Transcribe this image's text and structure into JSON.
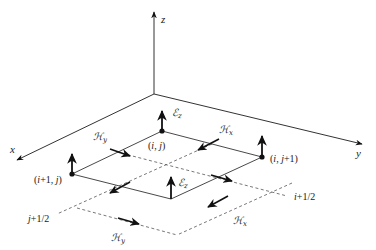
{
  "figure": {
    "colors": {
      "line": "#333333",
      "dashed": "#555555",
      "arrow": "#111111",
      "background": "#ffffff"
    }
  },
  "axes": {
    "origin": [
      154,
      94
    ],
    "x": {
      "label": "x",
      "tip": [
        17,
        160
      ],
      "label_pos": [
        10,
        153
      ]
    },
    "y": {
      "label": "y",
      "tip": [
        362,
        144
      ],
      "label_pos": [
        356,
        157
      ]
    },
    "z": {
      "label": "z",
      "tip": [
        154,
        12
      ],
      "label_pos": [
        161,
        23
      ]
    }
  },
  "nodes": [
    {
      "id": "ij",
      "label": "(i, j)",
      "pos": [
        162,
        131
      ],
      "label_pos": [
        148,
        149
      ],
      "dot": true,
      "ez_tip": [
        162,
        111
      ]
    },
    {
      "id": "ij1",
      "label": "(i, j+1)",
      "pos": [
        262,
        157
      ],
      "label_pos": [
        270,
        162
      ],
      "dot": true,
      "ez_tip": [
        262,
        136
      ]
    },
    {
      "id": "i1j",
      "label": "(i+1, j)",
      "pos": [
        72,
        174
      ],
      "label_pos": [
        34,
        183
      ],
      "dot": true,
      "ez_tip": [
        72,
        154
      ]
    },
    {
      "id": "i1j1",
      "label": "",
      "pos": [
        171,
        199
      ],
      "label_pos": [
        0,
        0
      ],
      "dot": false,
      "ez_tip": [
        171,
        177
      ]
    }
  ],
  "ez_labels": [
    {
      "text": "ℰ",
      "sub": "z",
      "pos": [
        172,
        116
      ]
    },
    {
      "text": "ℰ",
      "sub": "z",
      "pos": [
        178,
        186
      ]
    }
  ],
  "solid_edges": [
    [
      [
        162,
        131
      ],
      [
        262,
        157
      ]
    ],
    [
      [
        162,
        131
      ],
      [
        72,
        174
      ]
    ],
    [
      [
        72,
        174
      ],
      [
        171,
        199
      ]
    ],
    [
      [
        262,
        157
      ],
      [
        171,
        199
      ]
    ]
  ],
  "dashed_lines": [
    {
      "name": "j-plus-half-line",
      "from": [
        212,
        144
      ],
      "to": [
        57,
        214
      ]
    },
    {
      "name": "i-plus-half-line",
      "from": [
        117,
        152
      ],
      "to": [
        287,
        196
      ]
    },
    {
      "name": "j-plus-three-halves-line",
      "from": [
        292,
        183
      ],
      "to": [
        177,
        235
      ]
    },
    {
      "name": "i-plus-three-halves-line",
      "from": [
        77,
        208
      ],
      "to": [
        177,
        235
      ]
    }
  ],
  "grid_labels": [
    {
      "text": "j+1/2",
      "pos": [
        28,
        222
      ]
    },
    {
      "text": "i+1/2",
      "pos": [
        294,
        200
      ]
    }
  ],
  "h_arrows": [
    {
      "comp": "y",
      "from": [
        110,
        149
      ],
      "to": [
        130,
        156
      ],
      "label_pos": [
        93,
        140
      ]
    },
    {
      "comp": "x",
      "from": [
        219,
        139
      ],
      "to": [
        198,
        150
      ],
      "label_pos": [
        219,
        133
      ]
    },
    {
      "comp": "x",
      "from": [
        130,
        182
      ],
      "to": [
        110,
        193
      ],
      "label_pos": [
        0,
        0
      ],
      "no_label": true
    },
    {
      "comp": "y",
      "from": [
        211,
        175
      ],
      "to": [
        232,
        181
      ],
      "label_pos": [
        0,
        0
      ],
      "no_label": true
    },
    {
      "comp": "y",
      "from": [
        118,
        218
      ],
      "to": [
        139,
        224
      ],
      "label_pos": [
        111,
        241
      ]
    },
    {
      "comp": "x",
      "from": [
        228,
        196
      ],
      "to": [
        208,
        207
      ],
      "label_pos": [
        233,
        224
      ]
    }
  ],
  "h_symbol": "ℋ"
}
